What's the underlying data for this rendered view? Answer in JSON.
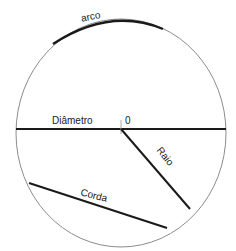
{
  "diagram": {
    "colors": {
      "stroke": "#1a1a1a",
      "circle": "#8c8c8c",
      "background": "#ffffff"
    },
    "circle": {
      "cx": 121,
      "cy": 133,
      "rx": 105,
      "ry": 114
    },
    "center_label": "0",
    "elements": [
      {
        "id": "arco",
        "label": "arco",
        "type": "arc"
      },
      {
        "id": "diametro",
        "label": "Diâmetro",
        "type": "diameter"
      },
      {
        "id": "raio",
        "label": "Raio",
        "type": "radius"
      },
      {
        "id": "corda",
        "label": "Corda",
        "type": "chord"
      }
    ]
  }
}
